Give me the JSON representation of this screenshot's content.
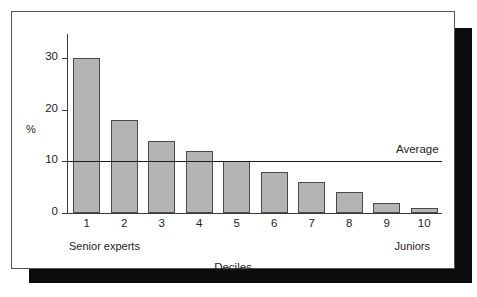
{
  "chart_data": {
    "type": "bar",
    "title": "",
    "subtitle": "",
    "xlabel": "Deciles",
    "ylabel": "%",
    "categories": [
      "1",
      "2",
      "3",
      "4",
      "5",
      "6",
      "7",
      "8",
      "9",
      "10"
    ],
    "values": [
      30,
      18,
      14,
      12,
      10,
      8,
      6,
      4,
      2,
      1
    ],
    "ylim": [
      0,
      35
    ],
    "y_ticks": [
      0,
      10,
      20,
      30
    ],
    "y_tick_labels": [
      "0",
      "10",
      "20",
      "30"
    ],
    "grid": false,
    "legend": null,
    "annotations": [
      {
        "name": "average-reference-line",
        "type": "horizontal-line",
        "value": 10,
        "label": "Average",
        "label_position": "right-above"
      },
      {
        "name": "x-axis-left-endpoint",
        "type": "axis-endpoint-label",
        "text": "Senior experts",
        "position": "left"
      },
      {
        "name": "x-axis-right-endpoint",
        "type": "axis-endpoint-label",
        "text": "Juniors",
        "position": "right"
      }
    ],
    "colors": {
      "bar_fill": "#b4b4b4",
      "bar_border": "#4a4a4a",
      "axis": "#3a3a3a",
      "text": "#1d1d1d",
      "average_line": "#1d1d1d",
      "frame_border": "#555555",
      "shadow": "#0b0b0b",
      "background": "#ffffff"
    }
  },
  "figure": {
    "average_label": "Average",
    "left_endpoint": "Senior experts",
    "right_endpoint": "Juniors",
    "x_axis_title": "Deciles",
    "y_axis_title": "%"
  }
}
